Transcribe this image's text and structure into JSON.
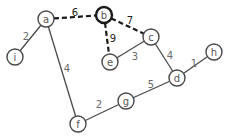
{
  "graph": {
    "nodes": [
      {
        "id": "a",
        "label": "a",
        "x": 46,
        "y": 19,
        "highlight": false
      },
      {
        "id": "b",
        "label": "b",
        "x": 104,
        "y": 15,
        "highlight": true
      },
      {
        "id": "c",
        "label": "c",
        "x": 151,
        "y": 37,
        "highlight": false
      },
      {
        "id": "d",
        "label": "d",
        "x": 177,
        "y": 78,
        "highlight": false
      },
      {
        "id": "e",
        "label": "e",
        "x": 110,
        "y": 62,
        "highlight": false
      },
      {
        "id": "f",
        "label": "f",
        "x": 78,
        "y": 124,
        "highlight": false
      },
      {
        "id": "g",
        "label": "g",
        "x": 126,
        "y": 101,
        "highlight": false
      },
      {
        "id": "h",
        "label": "h",
        "x": 214,
        "y": 52,
        "highlight": false
      },
      {
        "id": "i",
        "label": "i",
        "x": 15,
        "y": 57,
        "highlight": false
      }
    ],
    "edges": [
      {
        "from": "a",
        "to": "b",
        "weight": "6",
        "dashed": true,
        "lx": 75,
        "ly": 12
      },
      {
        "from": "b",
        "to": "c",
        "weight": "7",
        "dashed": true,
        "lx": 130,
        "ly": 20
      },
      {
        "from": "b",
        "to": "e",
        "weight": "9",
        "dashed": true,
        "lx": 113,
        "ly": 38
      },
      {
        "from": "a",
        "to": "i",
        "weight": "2",
        "dashed": false,
        "lx": 26,
        "ly": 36
      },
      {
        "from": "a",
        "to": "f",
        "weight": "4",
        "dashed": false,
        "lx": 67,
        "ly": 68
      },
      {
        "from": "c",
        "to": "e",
        "weight": "3",
        "dashed": false,
        "lx": 135,
        "ly": 56
      },
      {
        "from": "c",
        "to": "d",
        "weight": "4",
        "dashed": false,
        "lx": 170,
        "ly": 55
      },
      {
        "from": "d",
        "to": "h",
        "weight": "1",
        "dashed": false,
        "lx": 194,
        "ly": 63
      },
      {
        "from": "d",
        "to": "g",
        "weight": "5",
        "dashed": false,
        "lx": 151,
        "ly": 84
      },
      {
        "from": "f",
        "to": "g",
        "weight": "2",
        "dashed": false,
        "lx": 99,
        "ly": 104
      }
    ],
    "node_radius": 8,
    "colors": {
      "edge": "#4a4a4a",
      "highlight": "#1a1a1a",
      "background": "#ffffff"
    }
  }
}
